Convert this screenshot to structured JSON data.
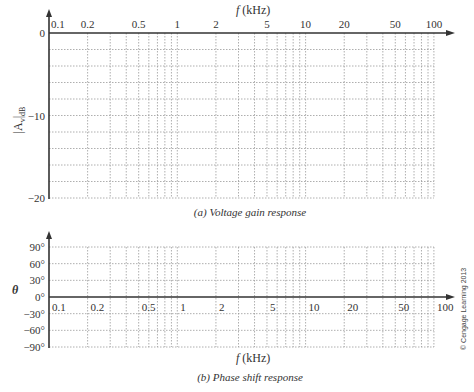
{
  "chart_data": [
    {
      "type": "line",
      "title": "(a) Voltage gain response",
      "xlabel": "f (kHz)",
      "ylabel": "|A_v|_dB",
      "x_scale": "log",
      "xlim": [
        0.1,
        100
      ],
      "ylim": [
        -20,
        0
      ],
      "x_tick_labels": [
        "0.1",
        "0.2",
        "0.5",
        "1",
        "2",
        "5",
        "10",
        "20",
        "50",
        "100"
      ],
      "x_ticks": [
        0.1,
        0.2,
        0.5,
        1,
        2,
        5,
        10,
        20,
        50,
        100
      ],
      "y_tick_labels": [
        "0",
        "−10",
        "−20"
      ],
      "y_ticks": [
        0,
        -10,
        -20
      ],
      "y_gridlines": [
        -2,
        -4,
        -6,
        -8,
        -10,
        -12,
        -14,
        -16,
        -18,
        -20
      ],
      "x_gridlines": [
        0.2,
        0.3,
        0.4,
        0.5,
        0.6,
        0.7,
        0.8,
        0.9,
        1,
        2,
        3,
        4,
        5,
        6,
        7,
        8,
        9,
        10,
        20,
        30,
        40,
        50,
        60,
        70,
        80,
        90,
        100
      ],
      "grid": true,
      "grid_style": "dotted",
      "series": [],
      "legend": null,
      "xaxis_position": "top"
    },
    {
      "type": "line",
      "title": "(b) Phase shift response",
      "xlabel": "f (kHz)",
      "ylabel": "θ",
      "x_scale": "log",
      "xlim": [
        0.1,
        100
      ],
      "ylim": [
        -90,
        90
      ],
      "x_tick_labels": [
        "0.1",
        "0.2",
        "0.5",
        "1",
        "2",
        "5",
        "10",
        "20",
        "50",
        "100"
      ],
      "x_ticks": [
        0.1,
        0.2,
        0.5,
        1,
        2,
        5,
        10,
        20,
        50,
        100
      ],
      "y_tick_labels": [
        "90°",
        "60°",
        "30°",
        "0°",
        "−30°",
        "−60°",
        "−90°"
      ],
      "y_ticks": [
        90,
        60,
        30,
        0,
        -30,
        -60,
        -90
      ],
      "x_gridlines": [
        0.2,
        0.3,
        0.4,
        0.5,
        0.6,
        0.7,
        0.8,
        0.9,
        1,
        2,
        3,
        4,
        5,
        6,
        7,
        8,
        9,
        10,
        20,
        30,
        40,
        50,
        60,
        70,
        80,
        90,
        100
      ],
      "grid": true,
      "grid_style": "dotted",
      "series": [],
      "legend": null,
      "xaxis_position": "at y=0"
    }
  ],
  "gain_chart": {
    "x_label": "f (kHz)",
    "y_label_main": "|A",
    "y_label_sub_v": "v",
    "y_label_sub_db": "dB",
    "caption": "(a) Voltage gain response"
  },
  "phase_chart": {
    "x_label": "f (kHz)",
    "y_label": "θ",
    "caption": "(b) Phase shift response"
  },
  "copyright": "© Cengage Learning 2013",
  "colors": {
    "axis": "#333333",
    "grid": "#9a9a9a",
    "text": "#333333"
  }
}
